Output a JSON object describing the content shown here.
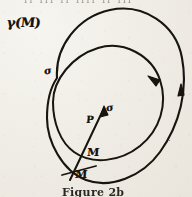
{
  "figure": {
    "caption": "Figure 2b",
    "top_bleed_text": "ıı ııı ıı ıııı ıı ııı",
    "media": "hand-drawn ink diagram on aged paper",
    "background_color": "#efece5",
    "ink_color": "#17130f",
    "labels": {
      "outer_curve": "γ(M)",
      "inner_curve_mark": "σ",
      "vector": "σ",
      "point_p": "P",
      "point_m_upper": "M",
      "point_m_lower": "M"
    },
    "elements": [
      {
        "name": "outer-closed-curve",
        "label": "γ(M)",
        "direction": "counterclockwise",
        "arrowheads": 1
      },
      {
        "name": "inner-closed-curve",
        "label": "σ",
        "direction": "counterclockwise",
        "arrowheads": 1
      },
      {
        "name": "transversal-segment",
        "label": "σ",
        "arrowheads": 1
      },
      {
        "name": "tick-mark-lower",
        "label": "M"
      }
    ]
  }
}
